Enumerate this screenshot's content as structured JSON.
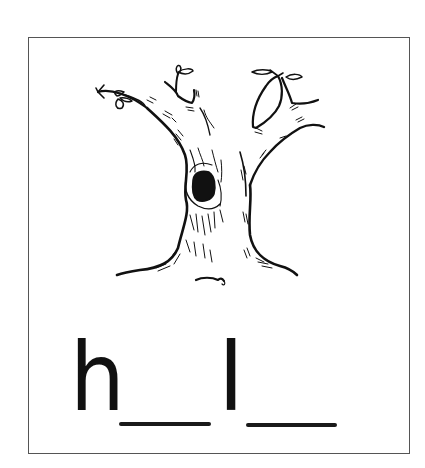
{
  "worksheet": {
    "picture": {
      "subject": "tree",
      "feature": "hole in trunk",
      "icon": "tree-with-hollow-illustration"
    },
    "word_puzzle": {
      "letters": [
        "h",
        "l"
      ],
      "blanks": [
        {
          "position": 2,
          "value": ""
        },
        {
          "position": 4,
          "value": ""
        }
      ],
      "pattern": "h _ l _"
    },
    "colors": {
      "border": "#555555",
      "ink": "#111111",
      "background": "#ffffff"
    }
  }
}
